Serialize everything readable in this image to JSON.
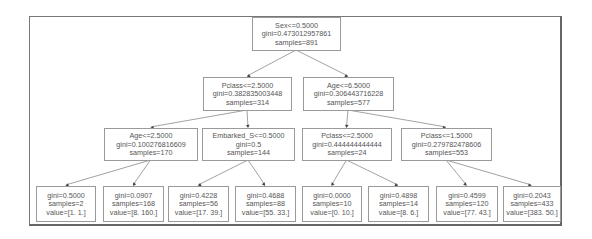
{
  "colors": {
    "box_border": "#9a9a9a",
    "text": "#555555",
    "edge": "#8a8a8a",
    "frame": "#777777"
  },
  "nodes": [
    {
      "id": "root",
      "x": 252,
      "y": 17,
      "w": 88,
      "h": 33,
      "lines": [
        "Sex<=0.5000",
        "gini=0.473012957861",
        "samples=891"
      ]
    },
    {
      "id": "n1",
      "x": 203,
      "y": 77,
      "w": 88,
      "h": 33,
      "lines": [
        "Pclass<=2.5000",
        "gini=0.382835003448",
        "samples=314"
      ]
    },
    {
      "id": "n2",
      "x": 303,
      "y": 77,
      "w": 90,
      "h": 33,
      "lines": [
        "Age<=6.5000",
        "gini=0.306443716228",
        "samples=577"
      ]
    },
    {
      "id": "n3",
      "x": 104,
      "y": 128,
      "w": 93,
      "h": 32,
      "lines": [
        "Age<=2.5000",
        "gini=0.100276816609",
        "samples=170"
      ]
    },
    {
      "id": "n4",
      "x": 202,
      "y": 128,
      "w": 92,
      "h": 32,
      "lines": [
        "Embarked_S<=0.5000",
        "gini=0.5",
        "samples=144"
      ]
    },
    {
      "id": "n5",
      "x": 302,
      "y": 128,
      "w": 89,
      "h": 32,
      "lines": [
        "Pclass<=2.5000",
        "gini=0.444444444444",
        "samples=24"
      ]
    },
    {
      "id": "n6",
      "x": 401,
      "y": 128,
      "w": 90,
      "h": 32,
      "lines": [
        "Pclass<=1.5000",
        "gini=0.279782478606",
        "samples=553"
      ]
    },
    {
      "id": "l1",
      "x": 36,
      "y": 186,
      "w": 59,
      "h": 35,
      "lines": [
        "gini=0.5000",
        "samples=2",
        "value=[1. 1.]"
      ]
    },
    {
      "id": "l2",
      "x": 103,
      "y": 186,
      "w": 60,
      "h": 35,
      "lines": [
        "gini=0.0907",
        "samples=168",
        "value=[8. 160.]"
      ]
    },
    {
      "id": "l3",
      "x": 168,
      "y": 186,
      "w": 60,
      "h": 35,
      "lines": [
        "gini=0.4228",
        "samples=56",
        "value=[17. 39.]"
      ]
    },
    {
      "id": "l4",
      "x": 235,
      "y": 186,
      "w": 60,
      "h": 35,
      "lines": [
        "gini=0.4688",
        "samples=88",
        "value=[55. 33.]"
      ]
    },
    {
      "id": "l5",
      "x": 302,
      "y": 186,
      "w": 59,
      "h": 35,
      "lines": [
        "gini=0.0000",
        "samples=10",
        "value=[0. 10.]"
      ]
    },
    {
      "id": "l6",
      "x": 368,
      "y": 186,
      "w": 60,
      "h": 35,
      "lines": [
        "gini=0.4898",
        "samples=14",
        "value=[8. 6.]"
      ]
    },
    {
      "id": "l7",
      "x": 436,
      "y": 186,
      "w": 61,
      "h": 35,
      "lines": [
        "gini=0.4599",
        "samples=120",
        "value=[77. 43.]"
      ]
    },
    {
      "id": "l8",
      "x": 503,
      "y": 186,
      "w": 57,
      "h": 35,
      "lines": [
        "gini=0.2043",
        "samples=433",
        "value=[383. 50.]"
      ]
    }
  ],
  "edges": [
    [
      "root",
      "n1"
    ],
    [
      "root",
      "n2"
    ],
    [
      "n1",
      "n3"
    ],
    [
      "n1",
      "n4"
    ],
    [
      "n2",
      "n5"
    ],
    [
      "n2",
      "n6"
    ],
    [
      "n3",
      "l1"
    ],
    [
      "n3",
      "l2"
    ],
    [
      "n4",
      "l3"
    ],
    [
      "n4",
      "l4"
    ],
    [
      "n5",
      "l5"
    ],
    [
      "n5",
      "l6"
    ],
    [
      "n6",
      "l7"
    ],
    [
      "n6",
      "l8"
    ]
  ]
}
